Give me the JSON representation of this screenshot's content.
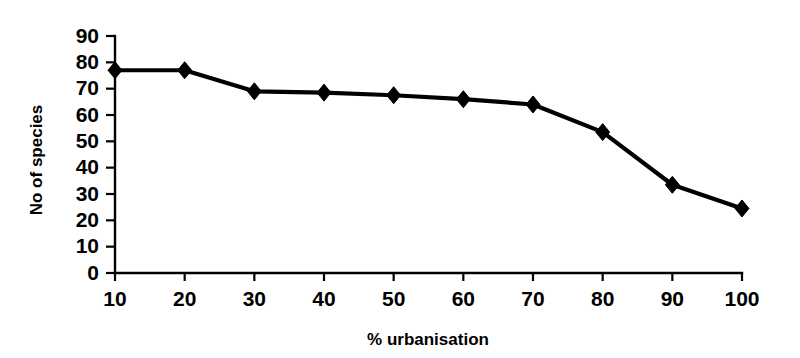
{
  "chart_data": {
    "type": "line",
    "title": "",
    "xlabel": "% urbanisation",
    "ylabel": "No of species",
    "x": [
      10,
      20,
      30,
      40,
      50,
      60,
      70,
      80,
      90,
      100
    ],
    "values": [
      77,
      77,
      69,
      68.5,
      67.5,
      66,
      64,
      53.5,
      33.5,
      24.5
    ],
    "categories": [
      "10",
      "20",
      "30",
      "40",
      "50",
      "60",
      "70",
      "80",
      "90",
      "100"
    ],
    "xtick_labels": [
      "10",
      "20",
      "30",
      "40",
      "50",
      "60",
      "70",
      "80",
      "90",
      "100"
    ],
    "ytick_labels": [
      "0",
      "10",
      "20",
      "30",
      "40",
      "50",
      "60",
      "70",
      "80",
      "90"
    ],
    "yticks": [
      0,
      10,
      20,
      30,
      40,
      50,
      60,
      70,
      80,
      90
    ],
    "xlim": [
      10,
      100
    ],
    "ylim": [
      0,
      90
    ],
    "grid": false,
    "legend": false,
    "marker": "diamond",
    "series_color": "#000000",
    "background_color": "#ffffff"
  },
  "axes": {
    "x_title": "% urbanisation",
    "y_title": "No of species"
  }
}
